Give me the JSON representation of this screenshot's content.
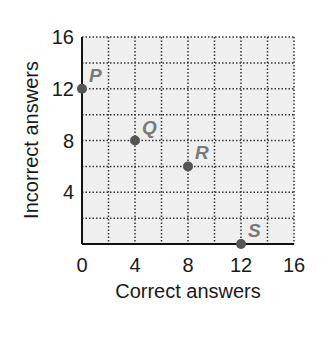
{
  "chart_data": {
    "type": "scatter",
    "title": "",
    "xlabel": "Correct answers",
    "ylabel": "Incorrect answers",
    "xlim": [
      0,
      16
    ],
    "ylim": [
      0,
      16
    ],
    "x_ticks": [
      "0",
      "4",
      "8",
      "12",
      "16"
    ],
    "y_ticks": [
      "4",
      "8",
      "12",
      "16"
    ],
    "grid": true,
    "grid_step": 2,
    "points": [
      {
        "label": "P",
        "x": 0,
        "y": 12
      },
      {
        "label": "Q",
        "x": 4,
        "y": 8
      },
      {
        "label": "R",
        "x": 8,
        "y": 6
      },
      {
        "label": "S",
        "x": 12,
        "y": 0
      }
    ],
    "colors": {
      "plot_bg": "#efefef",
      "grid": "#333333",
      "point": "#555555",
      "point_label": "#7a7a7a"
    }
  }
}
